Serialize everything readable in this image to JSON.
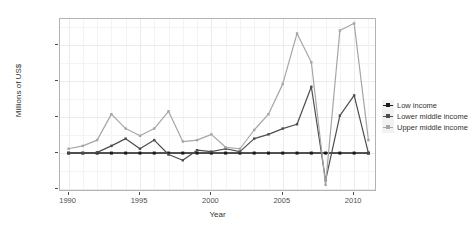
{
  "chart_data": {
    "type": "line",
    "title": "",
    "xlabel": "Year",
    "ylabel": "Millions of US$",
    "x": [
      1990,
      1991,
      1992,
      1993,
      1994,
      1995,
      1996,
      1997,
      1998,
      1999,
      2000,
      2001,
      2002,
      2003,
      2004,
      2005,
      2006,
      2007,
      2008,
      2009,
      2010,
      2011
    ],
    "xlim": [
      1989.4,
      2011.6
    ],
    "ylim": [
      -27000,
      93000
    ],
    "xticks": [
      1990,
      1995,
      2000,
      2005,
      2010
    ],
    "xtick_labels": [
      "1990",
      "1995",
      "2000",
      "2005",
      "2010"
    ],
    "yticks": [
      -25000,
      0,
      25000,
      50000,
      75000
    ],
    "ytick_labels": [
      "$-25,000",
      "$0",
      "$25,000",
      "$50,000",
      "$75,000"
    ],
    "grid": true,
    "legend_position": "right",
    "series": [
      {
        "name": "Low income",
        "color": "#1a1a1a",
        "values": [
          0,
          0,
          0,
          0,
          0,
          0,
          0,
          0,
          0,
          0,
          0,
          0,
          0,
          0,
          0,
          0,
          0,
          0,
          0,
          0,
          0,
          0
        ]
      },
      {
        "name": "Lower middle income",
        "color": "#4d4d4d",
        "values": [
          0,
          0,
          500,
          5000,
          10000,
          3000,
          9000,
          -1000,
          -5000,
          2000,
          1000,
          3000,
          1000,
          10000,
          13000,
          17000,
          20000,
          46000,
          -19000,
          26000,
          40000,
          0
        ]
      },
      {
        "name": "Upper middle income",
        "color": "#a6a6a6",
        "values": [
          3000,
          5000,
          9000,
          27000,
          17000,
          12000,
          17000,
          29000,
          8000,
          9000,
          13000,
          4000,
          3000,
          16000,
          27000,
          48000,
          83000,
          63000,
          -22000,
          85000,
          90000,
          9000
        ]
      }
    ]
  },
  "legend": {
    "items": [
      {
        "label": "Low income",
        "swatch": "line-marker-key"
      },
      {
        "label": "Lower middle income",
        "swatch": "line-marker-key"
      },
      {
        "label": "Upper middle income",
        "swatch": "line-marker-key"
      }
    ]
  },
  "colors": {
    "panel_background": "#ffffff",
    "panel_border": "#b3b3b3",
    "grid_major": "#eceaea",
    "grid_minor": "#f5f4f4",
    "axis_text": "#4d4d4d",
    "low_income": "#1a1a1a",
    "lower_middle_income": "#4d4d4d",
    "upper_middle_income": "#a6a6a6"
  }
}
